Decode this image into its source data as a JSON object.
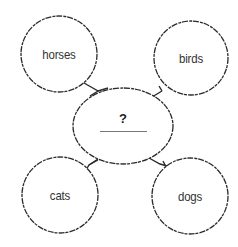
{
  "diagram": {
    "type": "concept-web",
    "center": {
      "prompt": "?",
      "answer": "",
      "shape": "ellipse",
      "cx": 123,
      "cy": 126,
      "rx": 50,
      "ry": 38
    },
    "nodes": [
      {
        "id": "horses",
        "label": "horses",
        "cx": 59,
        "cy": 54,
        "r": 38
      },
      {
        "id": "birds",
        "label": "birds",
        "cx": 191,
        "cy": 58,
        "r": 37
      },
      {
        "id": "cats",
        "label": "cats",
        "cx": 60,
        "cy": 195,
        "r": 38
      },
      {
        "id": "dogs",
        "label": "dogs",
        "cx": 190,
        "cy": 196,
        "r": 38
      }
    ],
    "colors": {
      "stroke": "#2a2a2a",
      "text": "#333333",
      "answer_line": "#777777",
      "background": "#ffffff"
    }
  }
}
